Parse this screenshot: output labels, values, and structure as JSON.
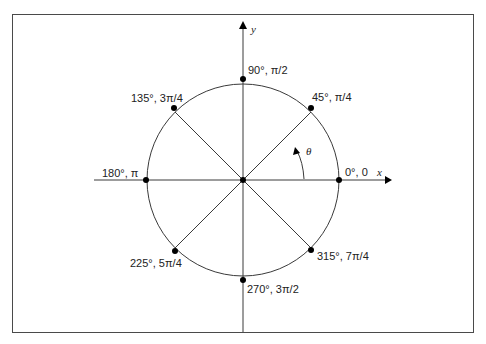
{
  "diagram": {
    "colors": {
      "line": "#3a3a3a",
      "point": "#000000",
      "border": "#4a4a4a",
      "text": "#222222"
    },
    "frame": {
      "x1": 12,
      "y1": 14,
      "x2": 473,
      "y2": 332
    },
    "center": {
      "x": 243,
      "y": 180
    },
    "radius": 96,
    "axes": {
      "x": {
        "label": "x",
        "from": 94,
        "to": 392
      },
      "y": {
        "label": "y",
        "from": 332,
        "to": 22
      }
    },
    "theta_label": "θ",
    "points": [
      {
        "deg": 0,
        "label": "0°, 0"
      },
      {
        "deg": 45,
        "label": "45°, π/4"
      },
      {
        "deg": 90,
        "label": "90°, π/2"
      },
      {
        "deg": 135,
        "label": "135°, 3π/4"
      },
      {
        "deg": 180,
        "label": "180°, π"
      },
      {
        "deg": 225,
        "label": "225°, 5π/4"
      },
      {
        "deg": 270,
        "label": "270°, 3π/2"
      },
      {
        "deg": 315,
        "label": "315°, 7π/4"
      }
    ]
  }
}
